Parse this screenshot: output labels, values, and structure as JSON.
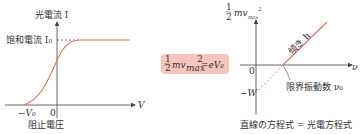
{
  "left_graph": {
    "y_axis_label": "光電流 I",
    "saturation_label": "饱和電流 I₀",
    "x_axis_label": "V",
    "stop_voltage_label": "−V₀",
    "origin": "0",
    "bottom_caption": "阻止電圧"
  },
  "equation": {
    "text": "½mv_max² = eV₀",
    "frac": "1/2",
    "body": "mv",
    "sub": "max",
    "sup": "2",
    "rhs": "=eV₀"
  },
  "right_graph": {
    "y_axis_label_frac": "1/2",
    "y_axis_label": "mv_max²",
    "x_axis_label": "ν",
    "origin": "0",
    "intercept_label": "−W",
    "slope_label": "傾き h",
    "threshold_label": "限界振動数 ν₀",
    "bottom_caption": "直線の方程式 = 光電方程式"
  },
  "colors": {
    "curve": "#e07060",
    "eq_bg": "#f6c4bb",
    "axis": "#444444"
  }
}
